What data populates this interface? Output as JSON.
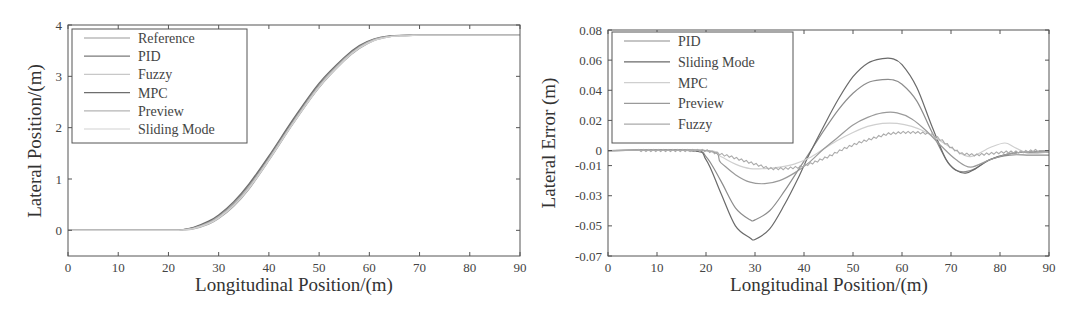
{
  "chart_data": [
    {
      "type": "line",
      "title": "",
      "xlabel": "Longitudinal Position/(m)",
      "ylabel": "Lateral Position/(m)",
      "xlim": [
        0,
        90
      ],
      "ylim": [
        -0.5,
        4
      ],
      "xticks": [
        0,
        10,
        20,
        30,
        40,
        50,
        60,
        70,
        80,
        90
      ],
      "yticks": [
        0,
        1,
        2,
        3,
        4
      ],
      "grid": false,
      "legend_position": "upper left",
      "series": [
        {
          "name": "Reference",
          "color": "#9a9a9a",
          "x": [
            0,
            20,
            22,
            25,
            28,
            30,
            33,
            36,
            40,
            45,
            50,
            55,
            58,
            61,
            64,
            67,
            70,
            75,
            90
          ],
          "y": [
            0,
            0,
            0.003,
            0.03,
            0.12,
            0.23,
            0.47,
            0.8,
            1.36,
            2.1,
            2.78,
            3.3,
            3.54,
            3.7,
            3.77,
            3.79,
            3.8,
            3.8,
            3.8
          ]
        },
        {
          "name": "PID",
          "color": "#7a7a7a",
          "x": [
            0,
            20,
            22,
            25,
            28,
            30,
            33,
            36,
            40,
            45,
            50,
            55,
            58,
            61,
            64,
            67,
            70,
            75,
            90
          ],
          "y": [
            0,
            0,
            0.005,
            0.05,
            0.16,
            0.28,
            0.53,
            0.87,
            1.42,
            2.16,
            2.84,
            3.35,
            3.58,
            3.72,
            3.78,
            3.8,
            3.8,
            3.8,
            3.8
          ]
        },
        {
          "name": "Fuzzy",
          "color": "#c8c8c8",
          "x": [
            0,
            20,
            22,
            25,
            28,
            30,
            33,
            36,
            40,
            45,
            50,
            55,
            58,
            61,
            64,
            67,
            70,
            75,
            90
          ],
          "y": [
            0,
            0,
            0.004,
            0.04,
            0.14,
            0.25,
            0.5,
            0.83,
            1.38,
            2.12,
            2.8,
            3.32,
            3.56,
            3.71,
            3.78,
            3.79,
            3.8,
            3.8,
            3.8
          ]
        },
        {
          "name": "MPC",
          "color": "#6e6e6e",
          "x": [
            0,
            20,
            22,
            25,
            28,
            30,
            33,
            36,
            40,
            45,
            50,
            55,
            58,
            61,
            64,
            67,
            70,
            75,
            90
          ],
          "y": [
            0,
            0,
            0.006,
            0.06,
            0.18,
            0.3,
            0.56,
            0.9,
            1.45,
            2.19,
            2.87,
            3.37,
            3.6,
            3.73,
            3.79,
            3.8,
            3.8,
            3.8,
            3.8
          ]
        },
        {
          "name": "Preview",
          "color": "#b4b4b4",
          "x": [
            0,
            20,
            22,
            25,
            28,
            30,
            33,
            36,
            40,
            45,
            50,
            55,
            58,
            61,
            64,
            67,
            70,
            75,
            90
          ],
          "y": [
            0,
            0,
            0.004,
            0.045,
            0.15,
            0.27,
            0.51,
            0.85,
            1.4,
            2.14,
            2.82,
            3.34,
            3.57,
            3.72,
            3.78,
            3.8,
            3.8,
            3.8,
            3.8
          ]
        },
        {
          "name": "Sliding Mode",
          "color": "#d2d2d2",
          "x": [
            0,
            20,
            22,
            25,
            28,
            30,
            33,
            36,
            40,
            45,
            50,
            55,
            58,
            61,
            64,
            67,
            70,
            75,
            90
          ],
          "y": [
            0,
            0,
            0.003,
            0.035,
            0.13,
            0.24,
            0.48,
            0.81,
            1.37,
            2.11,
            2.79,
            3.31,
            3.55,
            3.7,
            3.77,
            3.79,
            3.8,
            3.8,
            3.8
          ]
        }
      ]
    },
    {
      "type": "line",
      "title": "",
      "xlabel": "Longitudinal Position/(m)",
      "ylabel": "Lateral Error (m)",
      "xlim": [
        0,
        90
      ],
      "ylim": [
        -0.07,
        0.08
      ],
      "xticks": [
        0,
        10,
        20,
        30,
        40,
        50,
        60,
        70,
        80,
        90
      ],
      "yticks": [
        0.08,
        0.06,
        0.04,
        0.02,
        0,
        -0.01,
        -0.03,
        -0.05,
        -0.07
      ],
      "ytick_labels": [
        "0.08",
        "0.06",
        "0.04",
        "0.02",
        "0",
        "-0.01",
        "-0.03",
        "-0.05",
        "-0.07"
      ],
      "grid": false,
      "legend_position": "upper left",
      "series": [
        {
          "name": "PID",
          "color": "#8c8c8c",
          "x": [
            0,
            17,
            20,
            23,
            26,
            29,
            30,
            33,
            36,
            39,
            41,
            44,
            47,
            50,
            53,
            56,
            58,
            60,
            63,
            66,
            69,
            71,
            73,
            75,
            78,
            82,
            86,
            90
          ],
          "y": [
            0,
            0,
            -0.004,
            -0.02,
            -0.038,
            -0.046,
            -0.046,
            -0.04,
            -0.027,
            -0.012,
            -0.002,
            0.013,
            0.027,
            0.038,
            0.045,
            0.047,
            0.047,
            0.044,
            0.033,
            0.013,
            -0.006,
            -0.013,
            -0.014,
            -0.012,
            -0.006,
            -0.003,
            -0.003,
            -0.003
          ]
        },
        {
          "name": "Sliding Mode",
          "color": "#6a6a6a",
          "x": [
            0,
            17,
            20,
            23,
            26,
            29,
            30,
            33,
            36,
            39,
            41,
            44,
            47,
            50,
            53,
            56,
            58,
            60,
            63,
            66,
            69,
            71,
            73,
            75,
            78,
            82,
            86,
            90
          ],
          "y": [
            0,
            0,
            -0.006,
            -0.028,
            -0.05,
            -0.058,
            -0.059,
            -0.052,
            -0.036,
            -0.017,
            -0.003,
            0.016,
            0.034,
            0.049,
            0.058,
            0.061,
            0.061,
            0.057,
            0.042,
            0.017,
            -0.006,
            -0.013,
            -0.015,
            -0.012,
            -0.006,
            -0.002,
            -0.001,
            -0.001
          ]
        },
        {
          "name": "MPC",
          "color": "#cfcfcf",
          "x": [
            0,
            20,
            23,
            26,
            29,
            32,
            35,
            38,
            41,
            44,
            47,
            50,
            53,
            56,
            59,
            62,
            65,
            68,
            71,
            74,
            78,
            81,
            83,
            86,
            90
          ],
          "y": [
            0,
            0,
            -0.004,
            -0.009,
            -0.012,
            -0.012,
            -0.011,
            -0.009,
            -0.005,
            0.001,
            0.007,
            0.012,
            0.016,
            0.018,
            0.018,
            0.016,
            0.012,
            0.006,
            0.0,
            -0.004,
            0.002,
            0.005,
            0.002,
            -0.002,
            -0.001
          ]
        },
        {
          "name": "Preview",
          "color": "#9a9a9a",
          "x": [
            0,
            20,
            23,
            26,
            29,
            32,
            35,
            38,
            41,
            44,
            47,
            50,
            53,
            56,
            59,
            62,
            65,
            68,
            71,
            74,
            78,
            82,
            86,
            90
          ],
          "y": [
            0,
            0,
            -0.008,
            -0.016,
            -0.021,
            -0.022,
            -0.02,
            -0.015,
            -0.008,
            0.001,
            0.009,
            0.017,
            0.022,
            0.025,
            0.025,
            0.021,
            0.013,
            0.003,
            -0.006,
            -0.011,
            -0.006,
            -0.002,
            -0.001,
            -0.001
          ]
        },
        {
          "name": "Fuzzy",
          "color": "#aaaaaa",
          "x": [
            0,
            6,
            20,
            25,
            30,
            33,
            36,
            39,
            42,
            45,
            48,
            51,
            54,
            57,
            60,
            63,
            66,
            68,
            70,
            72,
            75,
            78,
            81,
            84,
            87,
            90
          ],
          "y": [
            0,
            0,
            0,
            -0.004,
            -0.009,
            -0.012,
            -0.012,
            -0.011,
            -0.008,
            -0.004,
            0.001,
            0.005,
            0.008,
            0.011,
            0.012,
            0.012,
            0.011,
            0.007,
            0.002,
            -0.002,
            -0.003,
            -0.002,
            -0.001,
            -0.001,
            0,
            0
          ],
          "chatter": true
        }
      ]
    }
  ],
  "charts": {
    "left": {
      "xlabel": "Longitudinal Position/(m)",
      "ylabel": "Lateral Position/(m)",
      "legend": [
        "Reference",
        "PID",
        "Fuzzy",
        "MPC",
        "Preview",
        "Sliding Mode"
      ]
    },
    "right": {
      "xlabel": "Longitudinal Position/(m)",
      "ylabel": "Lateral Error (m)",
      "legend": [
        "PID",
        "Sliding Mode",
        "MPC",
        "Preview",
        "Fuzzy"
      ]
    }
  }
}
